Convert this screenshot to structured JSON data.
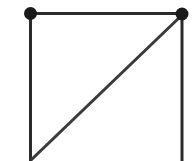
{
  "figure": {
    "kind": "geometric-graph-diagram",
    "width": 196,
    "height": 161,
    "background_color": "#ffffff"
  },
  "style": {
    "edge_color": "#2b2b2b",
    "edge_width": 3,
    "diagonal_color": "#3a3a3a",
    "diagonal_width": 3,
    "vertex_color": "#1a1a1a",
    "vertex_radius": 6.5
  },
  "vertices": [
    {
      "id": "A",
      "name": "top-left-vertex",
      "x": 30.5,
      "y": 13.5,
      "filled": true,
      "radius": 6.5,
      "color": "#1a1a1a"
    },
    {
      "id": "B",
      "name": "top-right-vertex",
      "x": 182,
      "y": 14,
      "filled": true,
      "radius": 6.5,
      "color": "#1a1a1a"
    }
  ],
  "edges": [
    {
      "id": "top",
      "name": "top-horizontal-edge",
      "from": "A",
      "to": "B",
      "x1": 30.5,
      "y1": 13.5,
      "x2": 182,
      "y2": 13.5,
      "color": "#2b2b2b",
      "width": 3
    },
    {
      "id": "left",
      "name": "left-vertical-edge",
      "from": "A",
      "to": "D",
      "x1": 30.5,
      "y1": 13.5,
      "x2": 30.5,
      "y2": 161,
      "color": "#2b2b2b",
      "width": 3
    },
    {
      "id": "right",
      "name": "right-vertical-edge",
      "from": "B",
      "to": "C",
      "x1": 182,
      "y1": 14,
      "x2": 182,
      "y2": 161,
      "color": "#2b2b2b",
      "width": 3
    },
    {
      "id": "diagonal",
      "name": "diagonal-edge",
      "from": "B",
      "to": "D",
      "x1": 181,
      "y1": 16,
      "x2": 31,
      "y2": 160,
      "color": "#3a3a3a",
      "width": 3
    }
  ]
}
